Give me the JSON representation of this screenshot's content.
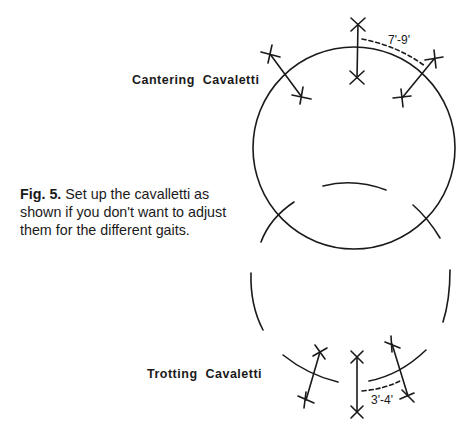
{
  "figure": {
    "number_label": "Fig. 5.",
    "caption_text": " Set up the cavalletti as shown if you don't want to adjust them for the different gaits."
  },
  "labels": {
    "canter": "Cantering  Cavaletti",
    "trot": "Trotting  Cavaletti"
  },
  "dimensions": {
    "canter_spacing": "7'-9'",
    "trot_spacing": "3'-4'"
  },
  "colors": {
    "ink": "#1a1a1a",
    "background": "#ffffff"
  }
}
